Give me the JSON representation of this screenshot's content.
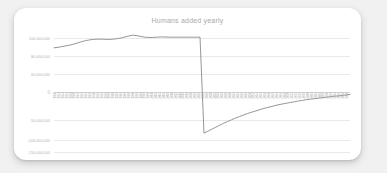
{
  "card": {
    "background": "#ffffff",
    "page_background": "#f1f1f1"
  },
  "chart_data": {
    "type": "line",
    "title": "Humans added yearly",
    "xlabel": "",
    "ylabel": "",
    "grid": true,
    "legend": "none",
    "line_color": "#8a8a8a",
    "ylim": [
      -150000000,
      100000000
    ],
    "yticks": [
      100000000,
      80000000,
      60000000,
      0,
      -50000000,
      -100000000,
      -150000000
    ],
    "ytick_labels": [
      "100,000,000",
      "80,000,000",
      "60,000,000",
      "0",
      "-50,000,000",
      "-100,000,000",
      "-150,000,000"
    ],
    "categories": [
      "1950",
      "1952",
      "1954",
      "1956",
      "1958",
      "1960",
      "1962",
      "1964",
      "1966",
      "1968",
      "1970",
      "1972",
      "1974",
      "1976",
      "1978",
      "1980",
      "1982",
      "1984",
      "1986",
      "1988",
      "1990",
      "1992",
      "1994",
      "1996",
      "1998",
      "2000",
      "2002",
      "2004",
      "2006",
      "2008",
      "2010",
      "2012",
      "2014",
      "2016",
      "2018",
      "2020",
      "2022",
      "2024",
      "2026",
      "2028",
      "2030",
      "2032",
      "2034",
      "2036",
      "2038",
      "2040",
      "2042",
      "2044",
      "2046",
      "2048",
      "2050",
      "2052",
      "2054",
      "2056",
      "2058",
      "2060",
      "2062",
      "2064",
      "2066",
      "2068",
      "2070",
      "2072",
      "2074",
      "2076",
      "2078",
      "2080",
      "2082",
      "2084",
      "2086",
      "2088",
      "2090",
      "2092",
      "2094",
      "2096",
      "2098",
      "2100"
    ],
    "values": [
      60000000,
      61000000,
      62500000,
      64000000,
      65500000,
      67500000,
      70000000,
      72500000,
      74500000,
      76000000,
      77000000,
      77500000,
      77500000,
      77000000,
      77000000,
      77500000,
      78500000,
      80000000,
      82000000,
      84000000,
      85500000,
      84500000,
      83000000,
      81500000,
      81000000,
      81000000,
      81500000,
      82000000,
      82000000,
      81500000,
      81500000,
      81500000,
      81500000,
      81500000,
      81500000,
      81500000,
      81500000,
      81500000,
      -112000000,
      -108000000,
      -104000000,
      -100000000,
      -96000000,
      -92000000,
      -88500000,
      -85000000,
      -81500000,
      -78500000,
      -75500000,
      -72500000,
      -70000000,
      -67500000,
      -65000000,
      -62500000,
      -60500000,
      -58500000,
      -56500000,
      -54500000,
      -53000000,
      -51500000,
      -50000000,
      -48500000,
      -47000000,
      -46000000,
      -44500000,
      -43500000,
      -42500000,
      -41500000,
      -40500000,
      -39500000,
      -38500000,
      -37500000,
      -37000000,
      -36000000,
      -35000000,
      -34000000
    ],
    "annotations": [
      {
        "label": "sharp drop",
        "at_index": 38
      }
    ]
  }
}
